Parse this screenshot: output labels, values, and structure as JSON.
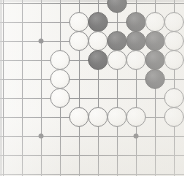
{
  "board": {
    "name": "go-board",
    "game": "Go",
    "background_color": "#f3f2ef",
    "line_color": "#55565a",
    "star_point_color": "#232326",
    "black_stone_color": "#141416",
    "white_stone_color": "#f8f7f4",
    "grid_spacing_px": 19,
    "stone_diameter_px": 20,
    "columns_px": [
      3,
      22,
      41,
      60,
      79,
      98,
      117,
      136,
      155,
      174
    ],
    "rows_px": [
      3,
      22,
      41,
      60,
      79,
      98,
      117,
      136,
      155,
      174
    ],
    "star_points": [
      {
        "name": "star-point-upper-left",
        "x": 41,
        "y": 41
      },
      {
        "name": "star-point-lower-left",
        "x": 41,
        "y": 136
      },
      {
        "name": "star-point-lower-right",
        "x": 136,
        "y": 136
      }
    ],
    "stones": [
      {
        "color": "black",
        "x": 117,
        "y": 3
      },
      {
        "color": "white",
        "x": 79,
        "y": 22
      },
      {
        "color": "black",
        "x": 98,
        "y": 22
      },
      {
        "color": "black",
        "x": 136,
        "y": 22
      },
      {
        "color": "white",
        "x": 155,
        "y": 22
      },
      {
        "color": "white",
        "x": 174,
        "y": 22
      },
      {
        "color": "white",
        "x": 79,
        "y": 41
      },
      {
        "color": "white",
        "x": 98,
        "y": 41
      },
      {
        "color": "black",
        "x": 117,
        "y": 41
      },
      {
        "color": "black",
        "x": 136,
        "y": 41
      },
      {
        "color": "black",
        "x": 155,
        "y": 41
      },
      {
        "color": "white",
        "x": 174,
        "y": 41
      },
      {
        "color": "white",
        "x": 60,
        "y": 60
      },
      {
        "color": "black",
        "x": 98,
        "y": 60
      },
      {
        "color": "white",
        "x": 117,
        "y": 60
      },
      {
        "color": "white",
        "x": 136,
        "y": 60
      },
      {
        "color": "black",
        "x": 155,
        "y": 60
      },
      {
        "color": "white",
        "x": 174,
        "y": 60
      },
      {
        "color": "white",
        "x": 60,
        "y": 79
      },
      {
        "color": "black",
        "x": 155,
        "y": 79
      },
      {
        "color": "white",
        "x": 60,
        "y": 98
      },
      {
        "color": "white",
        "x": 174,
        "y": 98
      },
      {
        "color": "white",
        "x": 79,
        "y": 117
      },
      {
        "color": "white",
        "x": 98,
        "y": 117
      },
      {
        "color": "white",
        "x": 117,
        "y": 117
      },
      {
        "color": "white",
        "x": 136,
        "y": 117
      },
      {
        "color": "white",
        "x": 174,
        "y": 117
      }
    ],
    "counts": {
      "black": 9,
      "white": 18,
      "total": 27
    }
  }
}
